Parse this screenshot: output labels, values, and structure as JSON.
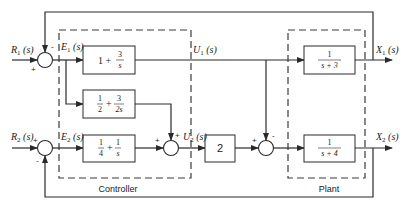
{
  "signals": {
    "r1": {
      "main": "R",
      "sub": "1",
      "arg": " (s)"
    },
    "r2": {
      "main": "R",
      "sub": "2",
      "arg": " (s)"
    },
    "e1": {
      "main": "E",
      "sub": "1",
      "arg": " (s)"
    },
    "e2": {
      "main": "E",
      "sub": "2",
      "arg": " (s)"
    },
    "u1": {
      "main": "U",
      "sub": "1",
      "arg": " (s)"
    },
    "u2": {
      "main": "U",
      "sub": "2",
      "arg": " (s)"
    },
    "x1": {
      "main": "X",
      "sub": "1",
      "arg": " (s)"
    },
    "x2": {
      "main": "X",
      "sub": "2",
      "arg": " (s)"
    }
  },
  "blocks": {
    "c11": {
      "lead": "1 +",
      "num": "3",
      "den": "s"
    },
    "c21": {
      "lead_num": "1",
      "lead_den": "2",
      "plus": "+",
      "num": "3",
      "den": "2s"
    },
    "c22": {
      "lead_num": "1",
      "lead_den": "4",
      "plus": "+",
      "num": "1",
      "den": "s"
    },
    "gain": {
      "value": "2"
    },
    "p1": {
      "num": "1",
      "den": "s + 3"
    },
    "p2": {
      "num": "1",
      "den": "s + 4"
    }
  },
  "signs": {
    "sum1_in": "+",
    "sum1_fb": "-",
    "sum2_in": "+",
    "sum2_fb": "-",
    "sum3_in": "+",
    "sum3_top": "+",
    "sum4_in": "+",
    "sum4_top": "-"
  },
  "captions": {
    "controller": "Controller",
    "plant": "Plant"
  }
}
